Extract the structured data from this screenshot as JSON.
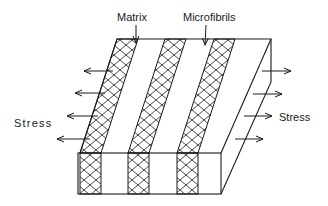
{
  "labels": {
    "matrix": "Matrix",
    "microfibrils": "Microfibrils",
    "stress_left": "Stress",
    "stress_right": "Stress"
  },
  "colors": {
    "line": "#1a1a1a",
    "background": "#ffffff"
  },
  "structure": {
    "fibril_bands": 3,
    "stress_arrows_left": 4,
    "stress_arrows_right": 4
  }
}
